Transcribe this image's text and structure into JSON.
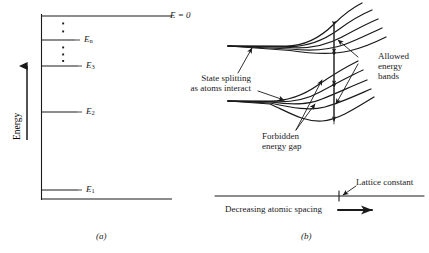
{
  "figure": {
    "panel_a": {
      "caption": "(a)",
      "axis_label": "Energy",
      "levels": [
        {
          "name": "E = 0",
          "label_main": "E",
          "label_sub": "",
          "suffix": " = 0",
          "y": 16,
          "x_end": 172
        },
        {
          "name": "E_n",
          "label_main": "E",
          "label_sub": "n",
          "suffix": "",
          "y": 40,
          "x_end": 75
        },
        {
          "name": "E_3",
          "label_main": "E",
          "label_sub": "3",
          "suffix": "",
          "y": 66,
          "x_end": 78
        },
        {
          "name": "E_2",
          "label_main": "E",
          "label_sub": "2",
          "suffix": "",
          "y": 112,
          "x_end": 77
        },
        {
          "name": "E_1",
          "label_main": "E",
          "label_sub": "1",
          "suffix": "",
          "y": 190,
          "x_end": 78
        }
      ],
      "ellipsis_upper_count": 2,
      "ellipsis_lower_count": 3
    },
    "panel_b": {
      "caption": "(b)",
      "annotations": {
        "state_splitting_line1": "State splitting",
        "state_splitting_line2": "as atoms interact",
        "allowed_line1": "Allowed",
        "allowed_line2": "energy",
        "allowed_line3": "bands",
        "forbidden_line1": "Forbidden",
        "forbidden_line2": "energy gap",
        "lattice_constant": "Lattice constant",
        "x_axis_label": "Decreasing atomic spacing"
      },
      "band_curve_count_upper": 5,
      "band_curve_count_lower": 5
    },
    "colors": {
      "ink": "#1a1a1a",
      "background": "#ffffff"
    }
  }
}
